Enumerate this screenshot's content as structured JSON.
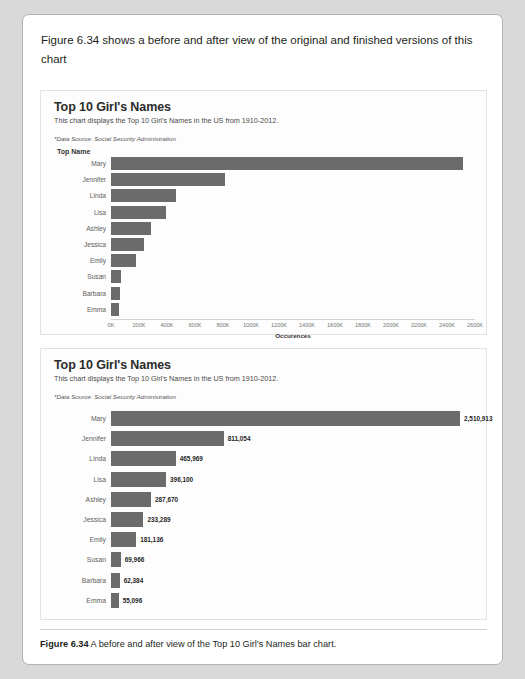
{
  "intro": {
    "text": "Figure 6.34 shows a before and after view of the original and finished versions of this chart"
  },
  "caption": {
    "label": "Figure 6.34",
    "text": "A before and after view of the Top 10 Girl's Names bar chart."
  },
  "colors": {
    "bar": "#6b6b6b",
    "page_background": "#d9d9d9",
    "card_background": "#ffffff",
    "panel_background": "#fdfdfd"
  },
  "chart_data": [
    {
      "id": "before",
      "type": "bar",
      "orientation": "horizontal",
      "title": "Top 10 Girl's Names",
      "subtitle": "This chart displays the Top 10 Girl's Names in the US from 1910-2012.",
      "source_note": "*Data Source: Social Security Administration",
      "category_axis_header": "Top Name",
      "xlabel": "Occurences",
      "ylabel": "Top Name",
      "categories": [
        "Mary",
        "Jennifer",
        "Linda",
        "Lisa",
        "Ashley",
        "Jessica",
        "Emily",
        "Susan",
        "Barbara",
        "Emma"
      ],
      "values": [
        2510913,
        811054,
        465969,
        396100,
        287670,
        233289,
        181136,
        69966,
        62384,
        55096
      ],
      "xlim": [
        0,
        2600000
      ],
      "xticks": [
        "0K",
        "200K",
        "400K",
        "600K",
        "800K",
        "1000K",
        "1200K",
        "1400K",
        "1600K",
        "1800K",
        "2000K",
        "2200K",
        "2400K",
        "2600K"
      ],
      "grid": false,
      "legend": "none",
      "data_labels": false
    },
    {
      "id": "after",
      "type": "bar",
      "orientation": "horizontal",
      "title": "Top 10 Girl's Names",
      "subtitle": "This chart displays the Top 10 Girl's Names in the US from 1910-2012.",
      "source_note": "*Data Source: Social Security Administration",
      "category_axis_header": "",
      "xlabel": "",
      "ylabel": "",
      "categories": [
        "Mary",
        "Jennifer",
        "Linda",
        "Lisa",
        "Ashley",
        "Jessica",
        "Emily",
        "Susan",
        "Barbara",
        "Emma"
      ],
      "values": [
        2510913,
        811054,
        465969,
        396100,
        287670,
        233289,
        181136,
        69966,
        62384,
        55096
      ],
      "value_labels": [
        "2,510,913",
        "811,054",
        "465,969",
        "396,100",
        "287,670",
        "233,289",
        "181,136",
        "69,966",
        "62,384",
        "55,096"
      ],
      "xlim": [
        0,
        2510913
      ],
      "xticks": [],
      "grid": false,
      "legend": "none",
      "data_labels": true
    }
  ]
}
